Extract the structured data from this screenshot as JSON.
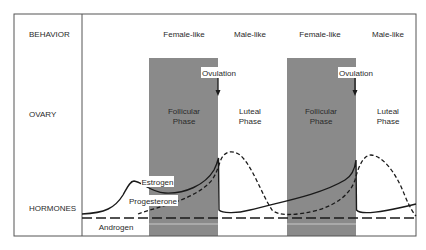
{
  "rows": {
    "behavior": "BEHAVIOR",
    "ovary": "OVARY",
    "hormones": "HORMONES"
  },
  "behavior_labels": [
    "Female-like",
    "Male-like",
    "Female-like",
    "Male-like"
  ],
  "phases": {
    "follicular_line1": "Follicular",
    "follicular_line2": "Phase",
    "luteal_line1": "Luteal",
    "luteal_line2": "Phase"
  },
  "events": {
    "ovulation": "Ovulation"
  },
  "hormones": {
    "estrogen": "Estrogen",
    "progesterone": "Progesterone",
    "androgen": "Androgen"
  },
  "legend_styles": {
    "estrogen": "solid",
    "progesterone": "short-dash",
    "androgen": "long-dash"
  },
  "colors": {
    "follicular_band": "#8a8a8a",
    "border": "#555555",
    "curve": "#1a1a1a"
  }
}
